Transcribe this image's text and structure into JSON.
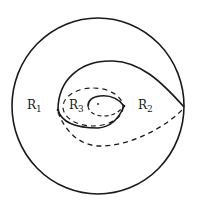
{
  "diagram": {
    "title": "",
    "regions": [
      {
        "id": "R1",
        "letter": "R",
        "sub": "1"
      },
      {
        "id": "R2",
        "letter": "R",
        "sub": "2"
      },
      {
        "id": "R3",
        "letter": "R",
        "sub": "3"
      }
    ],
    "stroke_color": "#1a1a1a",
    "elements": [
      "outer-circle",
      "outer-solid-loop",
      "outer-dashed-curve",
      "inner-dashed-ellipse",
      "inner-solid-teardrop",
      "center-dot"
    ]
  }
}
